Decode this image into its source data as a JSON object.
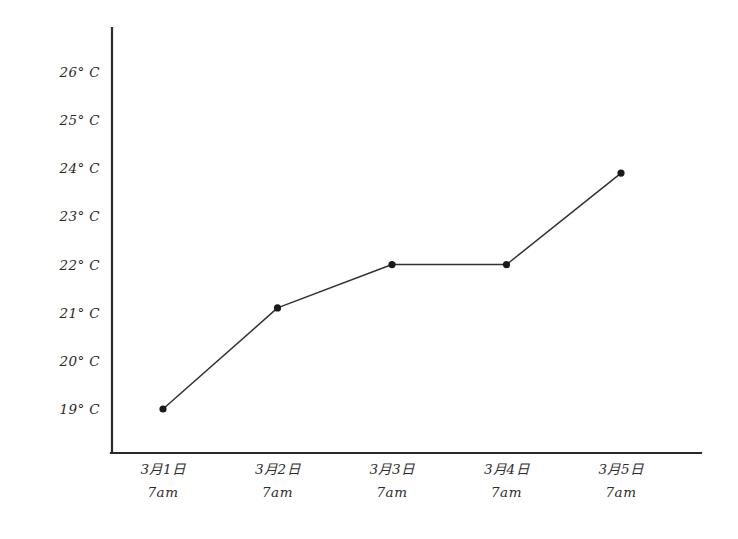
{
  "chart_data": {
    "type": "line",
    "title": "",
    "subtitle": "",
    "xlabel": "",
    "ylabel": "",
    "grid": false,
    "legend": null,
    "x": [
      "3月1日 7am",
      "3月2日 7am",
      "3月3日 7am",
      "3月4日 7am",
      "3月5日 7am"
    ],
    "categories": [
      "3月1日 7am",
      "3月2日 7am",
      "3月3日 7am",
      "3月4日 7am",
      "3月5日 7am"
    ],
    "values": [
      19.0,
      21.1,
      22.0,
      22.0,
      23.9
    ],
    "ylim": [
      18.3,
      26.6
    ],
    "yticks": [
      19,
      20,
      21,
      22,
      23,
      24,
      25,
      26
    ],
    "ytick_labels": [
      "19° C",
      "20° C",
      "21° C",
      "22° C",
      "23° C",
      "24° C",
      "25° C",
      "26° C"
    ],
    "xtick_dates": [
      "3月1日",
      "3月2日",
      "3月3日",
      "3月4日",
      "3月5日"
    ],
    "xtick_times": [
      "7am",
      "7am",
      "7am",
      "7am",
      "7am"
    ],
    "units": "°C",
    "marker": "filled-circle",
    "line_color": "#33312f",
    "marker_color": "#1a1a1a",
    "axis_color": "#2a2a2a",
    "background": "#ffffff"
  },
  "axes": {
    "y_axis_name": "temperature-axis",
    "x_axis_name": "date-time-axis"
  }
}
